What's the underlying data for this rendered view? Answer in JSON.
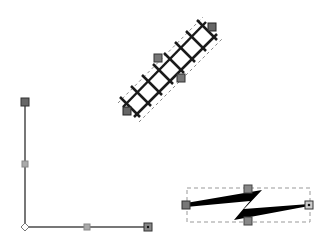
{
  "canvas": {
    "background": "#ffffff",
    "width": 330,
    "height": 238
  },
  "shapes": {
    "railway": {
      "name": "railway-track-connector",
      "start": [
        127,
        111
      ],
      "end": [
        212,
        27
      ],
      "mid_handles": [
        [
          158,
          58
        ],
        [
          181,
          78
        ]
      ],
      "color": "#1a1a1a"
    },
    "elbow": {
      "name": "elbow-connector",
      "points": [
        [
          25,
          102
        ],
        [
          25,
          227
        ],
        [
          148,
          227
        ]
      ],
      "mid_handles": [
        [
          25,
          164
        ],
        [
          87,
          227
        ]
      ],
      "color": "#777777"
    },
    "lightning": {
      "name": "lightning-connector",
      "start": [
        186,
        205
      ],
      "end": [
        309,
        205
      ],
      "bbox": [
        187,
        188,
        310,
        222
      ],
      "handles": [
        [
          248,
          189
        ],
        [
          248,
          221
        ]
      ],
      "color": "#000000"
    }
  },
  "handle_color": "#666666"
}
